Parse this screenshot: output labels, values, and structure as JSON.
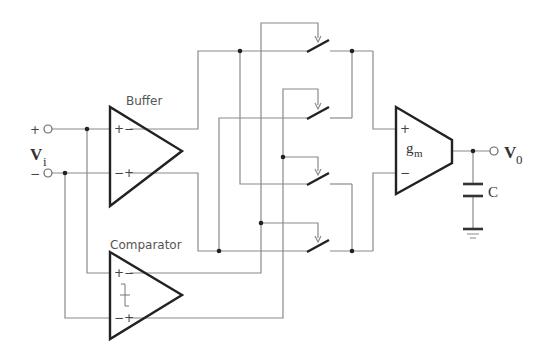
{
  "diagram": {
    "title": "",
    "labels": {
      "buffer": "Buffer",
      "comparator": "Comparator",
      "gm": "g",
      "gm_sub": "m",
      "vi": "V",
      "vi_sub": "i",
      "vo": "V",
      "vo_sub": "0",
      "cap": "C",
      "plus": "+",
      "minus": "−"
    },
    "components": [
      {
        "id": "buffer",
        "type": "differential-amplifier",
        "label": "Buffer"
      },
      {
        "id": "comparator",
        "type": "comparator-with-hysteresis",
        "label": "Comparator"
      },
      {
        "id": "switch-1",
        "type": "switch"
      },
      {
        "id": "switch-2",
        "type": "switch"
      },
      {
        "id": "switch-3",
        "type": "switch"
      },
      {
        "id": "switch-4",
        "type": "switch"
      },
      {
        "id": "gm-amp",
        "type": "transconductance-amplifier",
        "label": "gm"
      },
      {
        "id": "capacitor",
        "type": "capacitor",
        "label": "C"
      },
      {
        "id": "ground",
        "type": "ground"
      }
    ],
    "terminals": [
      {
        "id": "vi-plus",
        "polarity": "+"
      },
      {
        "id": "vi-minus",
        "polarity": "-"
      },
      {
        "id": "vo",
        "label": "V0"
      }
    ],
    "colors": {
      "wire": "#8a8a8a",
      "symbol": "#222222"
    }
  }
}
